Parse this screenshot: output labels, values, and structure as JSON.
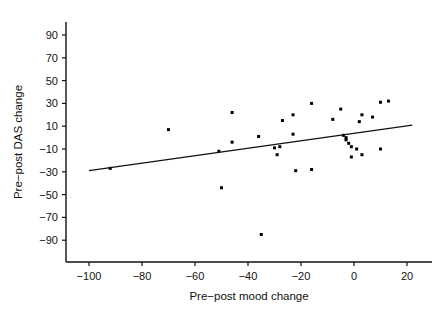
{
  "chart_data": {
    "type": "scatter",
    "title": "",
    "xlabel": "Pre−post mood change",
    "ylabel": "Pre−post DAS change",
    "xlim": [
      -108,
      26
    ],
    "ylim": [
      -100,
      98
    ],
    "xticks": [
      -100,
      -80,
      -60,
      -40,
      -20,
      0,
      20
    ],
    "xticklabels": [
      "−100",
      "−80",
      "−60",
      "−40",
      "−20",
      "0",
      "20"
    ],
    "yticks": [
      90,
      70,
      50,
      30,
      10,
      -10,
      -30,
      -50,
      -70,
      -90
    ],
    "yticklabels": [
      "90",
      "70",
      "50",
      "30",
      "10",
      "−10",
      "−30",
      "−50",
      "−70",
      "−90"
    ],
    "grid": false,
    "legend": null,
    "marker": "square",
    "marker_color": "#000000",
    "marker_size": 3,
    "points": [
      {
        "x": -92,
        "y": -27
      },
      {
        "x": -70,
        "y": 7
      },
      {
        "x": -51,
        "y": -12
      },
      {
        "x": -50,
        "y": -44
      },
      {
        "x": -46,
        "y": 22
      },
      {
        "x": -46,
        "y": -4
      },
      {
        "x": -36,
        "y": 1
      },
      {
        "x": -35,
        "y": -85
      },
      {
        "x": -30,
        "y": -9
      },
      {
        "x": -29,
        "y": -15
      },
      {
        "x": -28,
        "y": -8
      },
      {
        "x": -27,
        "y": 15
      },
      {
        "x": -23,
        "y": 20
      },
      {
        "x": -23,
        "y": 3
      },
      {
        "x": -22,
        "y": -29
      },
      {
        "x": -16,
        "y": 30
      },
      {
        "x": -16,
        "y": -28
      },
      {
        "x": -8,
        "y": 16
      },
      {
        "x": -5,
        "y": 25
      },
      {
        "x": -4,
        "y": 2
      },
      {
        "x": -3,
        "y": 0
      },
      {
        "x": -3,
        "y": -2
      },
      {
        "x": -2,
        "y": -5
      },
      {
        "x": -1,
        "y": -8
      },
      {
        "x": -1,
        "y": -17
      },
      {
        "x": 1,
        "y": -10
      },
      {
        "x": 2,
        "y": 14
      },
      {
        "x": 3,
        "y": 20
      },
      {
        "x": 3,
        "y": -15
      },
      {
        "x": 7,
        "y": 18
      },
      {
        "x": 10,
        "y": 31
      },
      {
        "x": 10,
        "y": -10
      },
      {
        "x": 13,
        "y": 32
      }
    ],
    "fit_line": {
      "x_start": -100,
      "y_start": -29,
      "x_end": 22,
      "y_end": 11
    }
  }
}
